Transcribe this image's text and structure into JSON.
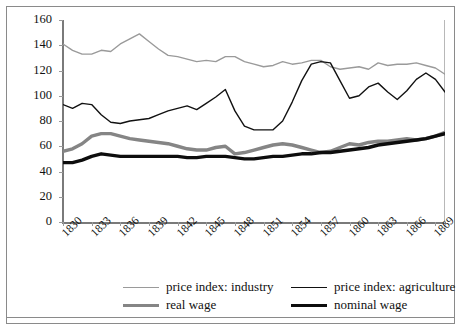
{
  "chart_data": {
    "type": "line",
    "title": "",
    "subtitle": "",
    "xlabel": "",
    "ylabel": "",
    "xlim": [
      1830,
      1870
    ],
    "ylim": [
      0,
      160
    ],
    "grid": false,
    "legend_position": "bottom",
    "ytick_labels": [
      "0",
      "20",
      "40",
      "60",
      "80",
      "100",
      "120",
      "140",
      "160"
    ],
    "ytick_values": [
      0,
      20,
      40,
      60,
      80,
      100,
      120,
      140,
      160
    ],
    "xtick_labels": [
      "1830",
      "1833",
      "1836",
      "1839",
      "1842",
      "1845",
      "1848",
      "1851",
      "1854",
      "1857",
      "1860",
      "1863",
      "1866",
      "1869"
    ],
    "xtick_values": [
      1830,
      1833,
      1836,
      1839,
      1842,
      1845,
      1848,
      1851,
      1854,
      1857,
      1860,
      1863,
      1866,
      1869
    ],
    "x": [
      1830,
      1831,
      1832,
      1833,
      1834,
      1835,
      1836,
      1837,
      1838,
      1839,
      1840,
      1841,
      1842,
      1843,
      1844,
      1845,
      1846,
      1847,
      1848,
      1849,
      1850,
      1851,
      1852,
      1853,
      1854,
      1855,
      1856,
      1857,
      1858,
      1859,
      1860,
      1861,
      1862,
      1863,
      1864,
      1865,
      1866,
      1867,
      1868,
      1869,
      1870
    ],
    "series": [
      {
        "name": "price index: industry",
        "color": "#9a9a9a",
        "width": 1.4,
        "values": [
          141,
          136,
          133,
          133,
          136,
          135,
          141,
          145,
          149,
          143,
          137,
          132,
          131,
          129,
          127,
          128,
          127,
          131,
          131,
          127,
          125,
          123,
          124,
          127,
          125,
          126,
          128,
          128,
          123,
          121,
          122,
          123,
          121,
          126,
          124,
          125,
          125,
          126,
          124,
          122,
          117
        ]
      },
      {
        "name": "price index: agriculture",
        "color": "#111111",
        "width": 1.4,
        "values": [
          93,
          90,
          94,
          93,
          85,
          79,
          78,
          80,
          81,
          82,
          85,
          88,
          90,
          92,
          89,
          94,
          99,
          105,
          88,
          76,
          73,
          73,
          73,
          80,
          95,
          112,
          125,
          127,
          126,
          112,
          98,
          100,
          107,
          110,
          103,
          97,
          104,
          113,
          118,
          113,
          103
        ]
      },
      {
        "name": "real wage",
        "color": "#858585",
        "width": 3.4,
        "values": [
          56,
          58,
          62,
          68,
          70,
          70,
          68,
          66,
          65,
          64,
          63,
          62,
          60,
          58,
          57,
          57,
          59,
          60,
          54,
          55,
          57,
          59,
          61,
          62,
          61,
          59,
          57,
          55,
          56,
          59,
          62,
          61,
          63,
          64,
          64,
          65,
          66,
          65,
          66,
          68,
          71
        ]
      },
      {
        "name": "nominal wage",
        "color": "#0d0d0d",
        "width": 3.4,
        "values": [
          47,
          47,
          49,
          52,
          54,
          53,
          52,
          52,
          52,
          52,
          52,
          52,
          52,
          51,
          51,
          52,
          52,
          52,
          51,
          50,
          50,
          51,
          52,
          52,
          53,
          54,
          54,
          55,
          55,
          56,
          57,
          58,
          59,
          61,
          62,
          63,
          64,
          65,
          66,
          68,
          70
        ]
      }
    ]
  },
  "legend": {
    "entries": [
      {
        "label": "price index: industry",
        "color": "#9a9a9a",
        "width": 1.4
      },
      {
        "label": "price index: agriculture",
        "color": "#111111",
        "width": 1.4
      },
      {
        "label": "real wage",
        "color": "#858585",
        "width": 3.4
      },
      {
        "label": "nominal wage",
        "color": "#0d0d0d",
        "width": 3.4
      }
    ]
  }
}
